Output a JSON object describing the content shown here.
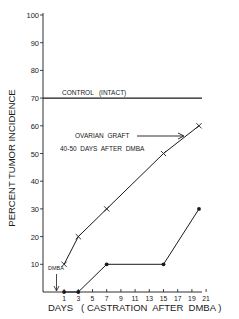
{
  "chart_data": {
    "type": "line",
    "title": "",
    "xlabel": "DAYS   ( CASTRATION  AFTER  DMBA )",
    "ylabel": "PERCENT  TUMOR  INCIDENCE",
    "x_ticks": [
      1,
      3,
      5,
      7,
      9,
      11,
      13,
      15,
      17,
      19,
      21
    ],
    "y_ticks": [
      10,
      20,
      30,
      40,
      50,
      60,
      70,
      80,
      90,
      100
    ],
    "ylim": [
      0,
      100
    ],
    "xlim": [
      0,
      22
    ],
    "grid": false,
    "series": [
      {
        "name": "Ovarian graft 40-50 days after DMBA",
        "marker": "x",
        "x": [
          1,
          3,
          7,
          15,
          20
        ],
        "y": [
          10,
          20,
          30,
          50,
          60
        ]
      },
      {
        "name": "Castration only",
        "marker": "filled-circle",
        "x": [
          1,
          3,
          7,
          15,
          20
        ],
        "y": [
          0,
          0,
          10,
          10,
          30
        ]
      }
    ],
    "reference_lines": [
      {
        "name": "Control (intact)",
        "y": 70
      }
    ],
    "annotations": [
      {
        "text": "CONTROL   (INTACT)",
        "target": "reference line at 70"
      },
      {
        "text": "OVARIAN  GRAFT",
        "arrow": "right",
        "target": "upper series"
      },
      {
        "text": "40-50  DAYS  AFTER  DMBA",
        "target": "upper series"
      },
      {
        "text": "DMBA",
        "arrow": "down",
        "x": 0
      }
    ]
  },
  "labels": {
    "ylabel": "PERCENT  TUMOR  INCIDENCE",
    "xlabel": "DAYS   ( CASTRATION  AFTER  DMBA )",
    "control": "CONTROL   (INTACT)",
    "graft1": "OVARIAN  GRAFT",
    "graft2": "40-50  DAYS  AFTER  DMBA",
    "dmba": "DMBA"
  }
}
